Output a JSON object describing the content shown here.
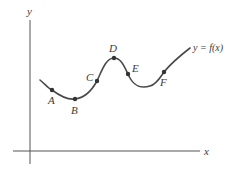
{
  "diagram": {
    "type": "function-graph",
    "axes": {
      "x_label": "x",
      "y_label": "y"
    },
    "curve": {
      "label": "y = f(x)",
      "color": "#4a4a4a"
    },
    "points": [
      {
        "name": "A",
        "label": "A"
      },
      {
        "name": "B",
        "label": "B"
      },
      {
        "name": "C",
        "label": "C"
      },
      {
        "name": "D",
        "label": "D"
      },
      {
        "name": "E",
        "label": "E"
      },
      {
        "name": "F",
        "label": "F"
      }
    ]
  }
}
